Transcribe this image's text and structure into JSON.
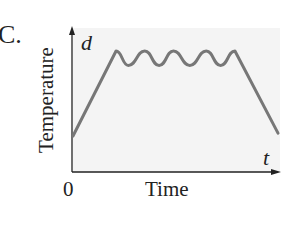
{
  "panel": {
    "label": "C."
  },
  "chart_data": {
    "type": "line",
    "title": "",
    "panel_label": "C.",
    "xlabel": "Time",
    "ylabel": "Temperature",
    "x_variable": "t",
    "y_variable": "d",
    "x_tick_labels": [
      "0"
    ],
    "grid": false,
    "legend": null,
    "series": [
      {
        "name": "temperature",
        "color": "#777777",
        "x": [
          0,
          0.21,
          0.27,
          0.35,
          0.42,
          0.49,
          0.57,
          0.65,
          0.72,
          0.79,
          1.0
        ],
        "y": [
          0.25,
          0.84,
          0.74,
          0.84,
          0.74,
          0.84,
          0.74,
          0.84,
          0.74,
          0.84,
          0.27
        ]
      }
    ],
    "xlim": [
      0,
      1
    ],
    "ylim": [
      0,
      1
    ]
  },
  "colors": {
    "curve": "#777777",
    "axis": "#222222",
    "plot_background": "#f4f4f4"
  }
}
